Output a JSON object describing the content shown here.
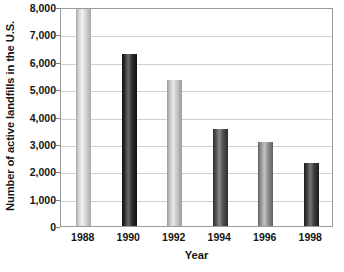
{
  "chart_data": {
    "type": "bar",
    "title": "",
    "subtitle": "",
    "xlabel": "Year",
    "ylabel": "Number of active landfills in the U.S.",
    "categories": [
      "1988",
      "1990",
      "1992",
      "1994",
      "1996",
      "1998"
    ],
    "values": [
      7950,
      6300,
      5350,
      3550,
      3080,
      2300
    ],
    "series": [
      {
        "name": "Active landfills",
        "values": [
          7950,
          6300,
          5350,
          3550,
          3080,
          2300
        ]
      }
    ],
    "ylim": [
      0,
      8000
    ],
    "ytick_labels": [
      "8,000",
      "7,000",
      "6,000",
      "5,000",
      "4,000",
      "3,000",
      "2,000",
      "1,000",
      "0"
    ],
    "ytick_values": [
      8000,
      7000,
      6000,
      5000,
      4000,
      3000,
      2000,
      1000,
      0
    ],
    "ytick_interval": 1000,
    "grid": "horizontal",
    "legend": "none",
    "annotations": [],
    "bar_colors": [
      "#d2d2d2",
      "#2e2e2e",
      "#c3c3c3",
      "#4f4f4f",
      "#8e8e8e",
      "#3b3b3b"
    ],
    "bar_shade_colors": [
      "#a9a9a9",
      "#0f0f0f",
      "#9b9b9b",
      "#2c2c2c",
      "#616161",
      "#1c1c1c"
    ],
    "bar_highlight_colors": [
      "#f2f2f2",
      "#6a6a6a",
      "#eaeaea",
      "#8a8a8a",
      "#c4c4c4",
      "#777777"
    ],
    "plot_border_color": "#9a9a9a",
    "gridline_color": "#cfcfcf",
    "background_color": "#ffffff",
    "text_color": "#151515"
  }
}
